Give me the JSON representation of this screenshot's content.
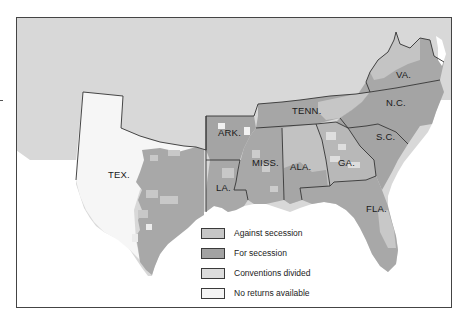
{
  "map": {
    "title": "Secession vote by county, 1860–1861",
    "colors": {
      "against_secession": "#c6c6c6",
      "for_secession": "#a2a2a2",
      "conventions_divided": "#dcdcdc",
      "no_returns": "#f4f4f4",
      "background_land": "#d8d8d8",
      "water": "#ffffff",
      "border": "#333333"
    },
    "state_labels": [
      {
        "id": "tex",
        "label": "TEX."
      },
      {
        "id": "ark",
        "label": "ARK."
      },
      {
        "id": "la",
        "label": "LA."
      },
      {
        "id": "miss",
        "label": "MISS."
      },
      {
        "id": "ala",
        "label": "ALA."
      },
      {
        "id": "tenn",
        "label": "TENN."
      },
      {
        "id": "ga",
        "label": "GA."
      },
      {
        "id": "fla",
        "label": "FLA."
      },
      {
        "id": "sc",
        "label": "S.C."
      },
      {
        "id": "nc",
        "label": "N.C."
      },
      {
        "id": "va",
        "label": "VA."
      }
    ]
  },
  "legend": {
    "items": [
      {
        "label": "Against secession",
        "color": "#c6c6c6"
      },
      {
        "label": "For secession",
        "color": "#a2a2a2"
      },
      {
        "label": "Conventions divided",
        "color": "#dcdcdc"
      },
      {
        "label": "No returns available",
        "color": "#f4f4f4"
      }
    ]
  }
}
